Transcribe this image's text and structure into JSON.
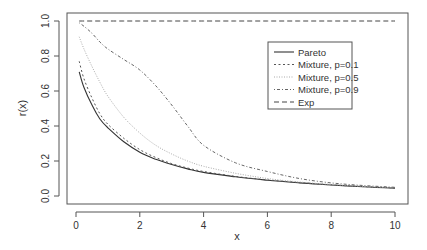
{
  "chart_data": {
    "type": "line",
    "title": "",
    "xlabel": "x",
    "ylabel": "r(x)",
    "xlim": [
      0,
      10
    ],
    "ylim": [
      0.0,
      1.0
    ],
    "x_ticks": [
      "0",
      "2",
      "4",
      "6",
      "8",
      "10"
    ],
    "y_ticks": [
      "0.0",
      "0.2",
      "0.4",
      "0.6",
      "0.8",
      "1.0"
    ],
    "grid": false,
    "legend_position": "top-right (inside)",
    "x": [
      0.1,
      0.25,
      0.5,
      0.75,
      1,
      1.5,
      2,
      2.5,
      3,
      3.5,
      4,
      5,
      6,
      7,
      8,
      9,
      10
    ],
    "series": [
      {
        "name": "Pareto",
        "style": "solid",
        "values": [
          0.71,
          0.62,
          0.52,
          0.44,
          0.39,
          0.31,
          0.25,
          0.21,
          0.18,
          0.155,
          0.135,
          0.11,
          0.09,
          0.075,
          0.063,
          0.053,
          0.045
        ]
      },
      {
        "name": "Mixture, p=0.1",
        "style": "dashed-short",
        "values": [
          0.77,
          0.67,
          0.56,
          0.47,
          0.41,
          0.33,
          0.265,
          0.22,
          0.185,
          0.16,
          0.14,
          0.112,
          0.092,
          0.077,
          0.064,
          0.054,
          0.046
        ]
      },
      {
        "name": "Mixture, p=0.5",
        "style": "dotted",
        "values": [
          0.91,
          0.84,
          0.74,
          0.65,
          0.57,
          0.45,
          0.36,
          0.29,
          0.24,
          0.2,
          0.17,
          0.13,
          0.1,
          0.08,
          0.066,
          0.055,
          0.047
        ]
      },
      {
        "name": "Mixture, p=0.9",
        "style": "dot-dash",
        "values": [
          0.99,
          0.97,
          0.93,
          0.88,
          0.84,
          0.78,
          0.72,
          0.63,
          0.52,
          0.4,
          0.29,
          0.19,
          0.14,
          0.1,
          0.075,
          0.06,
          0.05
        ]
      },
      {
        "name": "Exp",
        "style": "dashed-long",
        "values": [
          1.0,
          1.0,
          1.0,
          1.0,
          1.0,
          1.0,
          1.0,
          1.0,
          1.0,
          1.0,
          1.0,
          1.0,
          1.0,
          1.0,
          1.0,
          1.0,
          1.0
        ]
      }
    ]
  },
  "legend": {
    "items": [
      {
        "label": "Pareto",
        "style": "solid"
      },
      {
        "label": "Mixture, p=0.1",
        "style": "dashed-short"
      },
      {
        "label": "Mixture, p=0.5",
        "style": "dotted"
      },
      {
        "label": "Mixture, p=0.9",
        "style": "dot-dash"
      },
      {
        "label": "Exp",
        "style": "dashed-long"
      }
    ]
  },
  "colors": {
    "axis": "#555555",
    "pareto": "#333333",
    "mix01": "#555555",
    "mix05": "#aaaaaa",
    "mix09": "#666666",
    "exp": "#444444"
  }
}
